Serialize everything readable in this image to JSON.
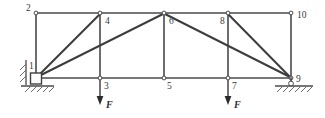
{
  "figure": {
    "kind": "truss-structural-diagram",
    "width": 325,
    "height": 118,
    "background_color": "#ffffff",
    "line_color": "#4a4a4a",
    "label_color": "#3a3a3a"
  },
  "geometry": {
    "top_chord_y": 13,
    "bottom_chord_y": 78,
    "panel_x": [
      36,
      100,
      164,
      228,
      291
    ]
  },
  "nodes": [
    {
      "id": "1",
      "label": "1",
      "x": 36,
      "y": 78,
      "label_x": 29,
      "label_y": 69,
      "joint_marker": false
    },
    {
      "id": "2",
      "label": "2",
      "x": 36,
      "y": 13,
      "label_x": 27,
      "label_y": 11,
      "joint_marker": true
    },
    {
      "id": "3",
      "label": "3",
      "x": 100,
      "y": 78,
      "label_x": 104,
      "label_y": 89,
      "joint_marker": true
    },
    {
      "id": "4",
      "label": "4",
      "x": 100,
      "y": 13,
      "label_x": 105,
      "label_y": 24,
      "joint_marker": true
    },
    {
      "id": "5",
      "label": "5",
      "x": 164,
      "y": 78,
      "label_x": 167,
      "label_y": 89,
      "joint_marker": true
    },
    {
      "id": "6",
      "label": "6",
      "x": 164,
      "y": 13,
      "label_x": 169,
      "label_y": 24,
      "joint_marker": true
    },
    {
      "id": "7",
      "label": "7",
      "x": 228,
      "y": 78,
      "label_x": 232,
      "label_y": 89,
      "joint_marker": true
    },
    {
      "id": "8",
      "label": "8",
      "x": 228,
      "y": 13,
      "label_x": 221,
      "label_y": 24,
      "joint_marker": true
    },
    {
      "id": "9",
      "label": "9",
      "x": 291,
      "y": 78,
      "label_x": 296,
      "label_y": 82,
      "joint_marker": true
    },
    {
      "id": "10",
      "label": "10",
      "x": 291,
      "y": 13,
      "label_x": 297,
      "label_y": 18,
      "joint_marker": true
    }
  ],
  "members": [
    {
      "name": "top-chord-2-4",
      "from": "2",
      "to": "4",
      "kind": "chord"
    },
    {
      "name": "top-chord-4-6",
      "from": "4",
      "to": "6",
      "kind": "chord"
    },
    {
      "name": "top-chord-6-8",
      "from": "6",
      "to": "8",
      "kind": "chord"
    },
    {
      "name": "top-chord-8-10",
      "from": "8",
      "to": "10",
      "kind": "chord"
    },
    {
      "name": "bottom-chord-1-3",
      "from": "1",
      "to": "3",
      "kind": "chord"
    },
    {
      "name": "bottom-chord-3-5",
      "from": "3",
      "to": "5",
      "kind": "chord"
    },
    {
      "name": "bottom-chord-5-7",
      "from": "5",
      "to": "7",
      "kind": "chord"
    },
    {
      "name": "bottom-chord-7-9",
      "from": "7",
      "to": "9",
      "kind": "chord"
    },
    {
      "name": "vertical-1-2",
      "from": "1",
      "to": "2",
      "kind": "vertical"
    },
    {
      "name": "vertical-3-4",
      "from": "3",
      "to": "4",
      "kind": "vertical"
    },
    {
      "name": "vertical-5-6",
      "from": "5",
      "to": "6",
      "kind": "vertical"
    },
    {
      "name": "vertical-7-8",
      "from": "7",
      "to": "8",
      "kind": "vertical"
    },
    {
      "name": "vertical-9-10",
      "from": "9",
      "to": "10",
      "kind": "vertical"
    },
    {
      "name": "diagonal-1-4",
      "from": "1",
      "to": "4",
      "kind": "diagonal"
    },
    {
      "name": "diagonal-1-6",
      "from": "1",
      "to": "6",
      "kind": "diagonal"
    },
    {
      "name": "diagonal-6-9",
      "from": "6",
      "to": "9",
      "kind": "diagonal"
    },
    {
      "name": "diagonal-8-9",
      "from": "8",
      "to": "9",
      "kind": "diagonal"
    }
  ],
  "loads": [
    {
      "name": "load-at-node-3",
      "label": "F",
      "at_node": "3",
      "x": 100,
      "tip_y": 104,
      "label_x": 107,
      "label_y": 108,
      "direction": "down"
    },
    {
      "name": "load-at-node-7",
      "label": "F",
      "at_node": "7",
      "x": 228,
      "tip_y": 104,
      "label_x": 235,
      "label_y": 108,
      "direction": "down"
    }
  ],
  "supports": [
    {
      "name": "pinned-support-node-1",
      "type": "pinned",
      "at_node": "1",
      "box": {
        "x": 30,
        "y": 73,
        "w": 12,
        "h": 11
      },
      "wall_x": 26,
      "wall_y1": 60,
      "wall_y2": 84,
      "ground_x1": 20,
      "ground_x2": 54,
      "ground_y": 86
    },
    {
      "name": "roller-support-node-9",
      "type": "roller",
      "at_node": "9",
      "ground_x1": 275,
      "ground_x2": 312,
      "ground_y": 86
    }
  ]
}
